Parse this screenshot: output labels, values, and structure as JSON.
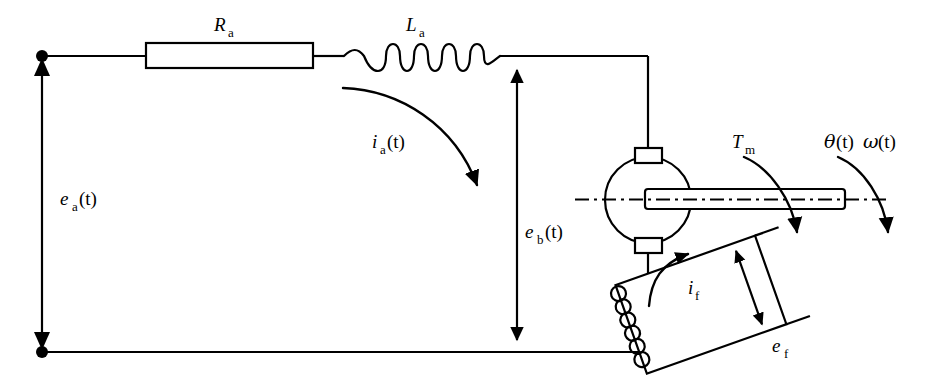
{
  "diagram": {
    "stroke_color": "#000000",
    "background_color": "#ffffff",
    "labels": {
      "armature_resistance": {
        "base": "R",
        "sub": "a",
        "full": "Ra"
      },
      "armature_inductance": {
        "base": "L",
        "sub": "a",
        "full": "La"
      },
      "armature_current": {
        "base": "i",
        "sub": "a",
        "arg": "(t)",
        "full": "ia(t)"
      },
      "armature_voltage": {
        "base": "e",
        "sub": "a",
        "arg": "(t)",
        "full": "ea(t)"
      },
      "back_emf": {
        "base": "e",
        "sub": "b",
        "arg": "(t)",
        "full": "eb(t)"
      },
      "motor_torque": {
        "base": "T",
        "sub": "m",
        "full": "Tm"
      },
      "angular_position": {
        "base": "θ",
        "arg": "(t)",
        "full": "θ(t)"
      },
      "angular_velocity": {
        "base": "ω",
        "arg": "(t)",
        "full": "ω(t)"
      },
      "field_current": {
        "base": "i",
        "sub": "f",
        "full": "if"
      },
      "field_voltage": {
        "base": "e",
        "sub": "f",
        "full": "ef"
      }
    },
    "components": [
      {
        "name": "resistor",
        "label": "Ra",
        "shape": "rectangle"
      },
      {
        "name": "inductor",
        "label": "La",
        "shape": "coil",
        "turns": 6
      },
      {
        "name": "motor",
        "label": "",
        "shape": "circle"
      },
      {
        "name": "brush-top",
        "label": "",
        "shape": "rectangle"
      },
      {
        "name": "brush-bottom",
        "label": "",
        "shape": "rectangle"
      },
      {
        "name": "rotor-shaft",
        "label": "",
        "shape": "dash-dot-bar"
      },
      {
        "name": "field-winding",
        "label": "if",
        "shape": "rotated-rectangle-coil"
      }
    ],
    "terminals": [
      {
        "name": "terminal-top",
        "type": "node-dot"
      },
      {
        "name": "terminal-bottom",
        "type": "node-dot"
      }
    ]
  }
}
